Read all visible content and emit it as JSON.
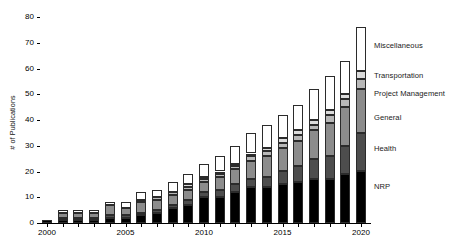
{
  "chart_data": {
    "type": "bar",
    "subtype": "stacked-bar",
    "title": "",
    "xlabel": "",
    "ylabel": "# of Publications",
    "ylim": [
      0,
      80
    ],
    "yticks": [
      0,
      10,
      20,
      30,
      40,
      50,
      60,
      70,
      80
    ],
    "xlim": [
      1999.4,
      2020.6
    ],
    "xticks": [
      2000,
      2005,
      2010,
      2015,
      2020
    ],
    "grid": false,
    "legend_position": "right-annotations",
    "categories": [
      2000,
      2001,
      2002,
      2003,
      2004,
      2005,
      2006,
      2007,
      2008,
      2009,
      2010,
      2011,
      2012,
      2013,
      2014,
      2015,
      2016,
      2017,
      2018,
      2019,
      2020
    ],
    "series": [
      {
        "name": "NRP",
        "color": "#000000",
        "values": [
          1,
          1,
          1,
          1,
          2,
          2,
          3,
          4,
          6,
          7,
          10,
          10,
          12,
          14,
          14,
          15,
          16,
          17,
          17,
          19,
          20
        ]
      },
      {
        "name": "Health",
        "color": "#4d4d4d",
        "values": [
          0,
          1,
          1,
          1,
          1,
          1,
          1,
          1,
          1,
          2,
          2,
          3,
          3,
          3,
          4,
          5,
          6,
          8,
          9,
          11,
          15
        ]
      },
      {
        "name": "General",
        "color": "#8c8c8c",
        "values": [
          0,
          2,
          2,
          2,
          4,
          3,
          4,
          4,
          4,
          4,
          4,
          5,
          6,
          7,
          8,
          9,
          10,
          11,
          13,
          15,
          17
        ]
      },
      {
        "name": "Project Management",
        "color": "#b8b8b8",
        "values": [
          0,
          0,
          0,
          0,
          0,
          0,
          1,
          1,
          1,
          1,
          1,
          1,
          1,
          2,
          2,
          2,
          2,
          2,
          3,
          3,
          4
        ]
      },
      {
        "name": "Transportation",
        "color": "#dcdcdc",
        "values": [
          0,
          0,
          0,
          0,
          0,
          0,
          0,
          0,
          0,
          1,
          1,
          1,
          1,
          1,
          1,
          2,
          2,
          2,
          2,
          2,
          3
        ]
      },
      {
        "name": "Miscellaneous",
        "color": "#ffffff",
        "values": [
          0,
          1,
          1,
          1,
          1,
          2,
          3,
          3,
          4,
          4,
          5,
          6,
          7,
          8,
          9,
          9,
          10,
          12,
          13,
          13,
          17
        ]
      }
    ],
    "totals": [
      1,
      5,
      5,
      5,
      8,
      8,
      12,
      13,
      16,
      19,
      23,
      26,
      30,
      35,
      38,
      42,
      46,
      52,
      57,
      63,
      76
    ]
  },
  "legend": {
    "items": [
      {
        "label": "Miscellaneous",
        "y": 41
      },
      {
        "label": "Transportation",
        "y": 71
      },
      {
        "label": "Project Management",
        "y": 89
      },
      {
        "label": "General",
        "y": 113
      },
      {
        "label": "Health",
        "y": 144
      },
      {
        "label": "NRP",
        "y": 182
      }
    ]
  },
  "caption": ""
}
